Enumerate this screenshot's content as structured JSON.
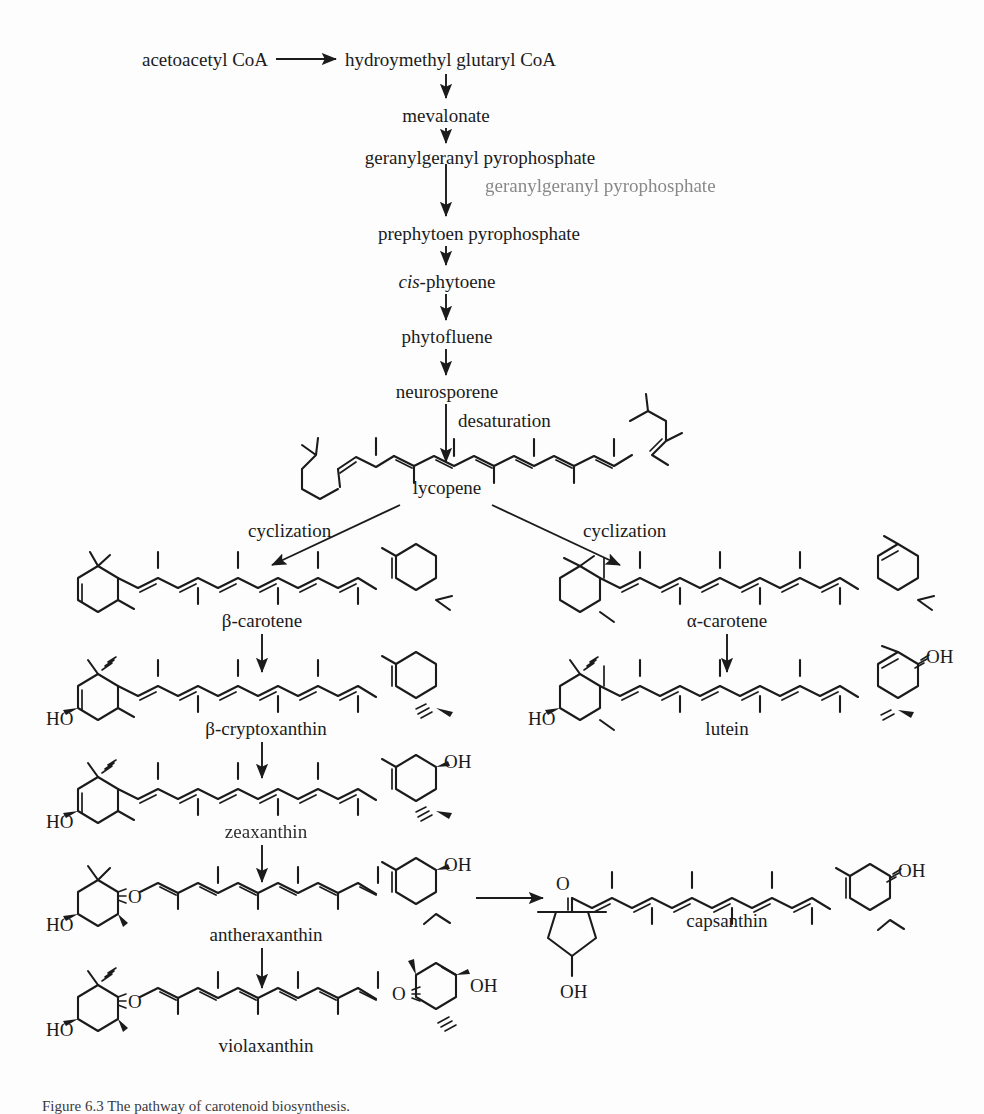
{
  "figure": {
    "domain": "chemical-pathway-diagram",
    "title_visible": false,
    "background": "#fdfdfd",
    "ink": "#1b1b1b"
  },
  "pathway": {
    "name": "Carotenoid biosynthesis pathway",
    "linear_chain": [
      {
        "id": "acetoacetyl-coa",
        "label": "acetoacetyl CoA"
      },
      {
        "id": "hmg-coa",
        "label": "hydroymethyl glutaryl CoA"
      },
      {
        "id": "mevalonate",
        "label": "mevalonate"
      },
      {
        "id": "ggpp",
        "label": "geranylgeranyl pyrophosphate"
      },
      {
        "id": "ggpp-duplicate",
        "label": "geranylgeranyl pyrophosphate"
      },
      {
        "id": "prephytoen-pp",
        "label": "prephytoen pyrophosphate"
      },
      {
        "id": "cis-phytoene",
        "label_italic": "cis",
        "label_rest": "-phytoene"
      },
      {
        "id": "phytofluene",
        "label": "phytofluene"
      },
      {
        "id": "neurosporene",
        "label": "neurosporene"
      },
      {
        "id": "lycopene",
        "label": "lycopene"
      }
    ],
    "reaction_labels": [
      {
        "id": "desaturation",
        "label": "desaturation"
      },
      {
        "id": "cyclization-left",
        "label": "cyclization"
      },
      {
        "id": "cyclization-right",
        "label": "cyclization"
      }
    ],
    "branch_left": [
      {
        "id": "beta-carotene",
        "label": "β-carotene"
      },
      {
        "id": "beta-cryptoxanthin",
        "label": "β-cryptoxanthin"
      },
      {
        "id": "zeaxanthin",
        "label": "zeaxanthin",
        "render": "smudged"
      },
      {
        "id": "antheraxanthin",
        "label": "antheraxanthin"
      },
      {
        "id": "violaxanthin",
        "label": "violaxanthin"
      }
    ],
    "branch_right": [
      {
        "id": "alpha-carotene",
        "label": "α-carotene"
      },
      {
        "id": "lutein",
        "label": "lutein"
      }
    ],
    "branch_side": [
      {
        "id": "capsanthin",
        "label": "capsanthin"
      }
    ]
  },
  "atoms": {
    "ho": "HO",
    "oh": "OH",
    "o": "O"
  },
  "caption": {
    "text": "Figure 6.3   The pathway of carotenoid biosynthesis.",
    "clipped": true
  }
}
